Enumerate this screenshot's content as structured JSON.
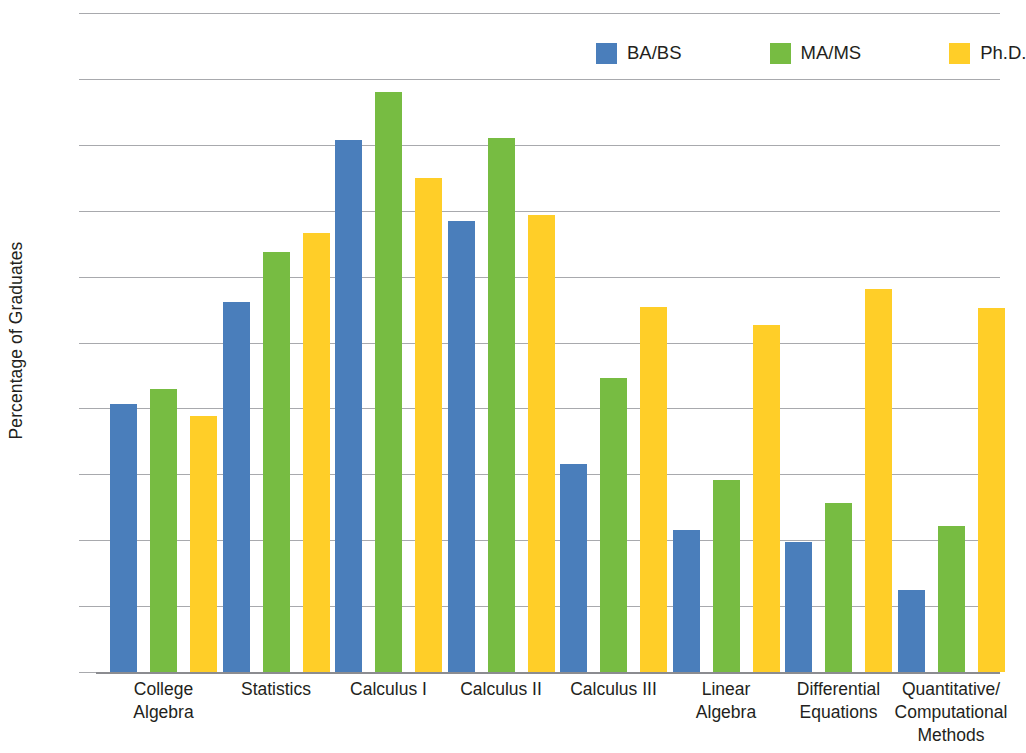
{
  "chart_data": {
    "type": "bar",
    "title": "",
    "xlabel": "",
    "ylabel": "Percentage of Graduates",
    "ylim": [
      0,
      100
    ],
    "ytick_labels": [
      "100%",
      "90%",
      "80%",
      "70%",
      "60%",
      "50%",
      "40%",
      "30%",
      "20%",
      "10%",
      "0%"
    ],
    "ytick_values": [
      100,
      90,
      80,
      70,
      60,
      50,
      40,
      30,
      20,
      10,
      0
    ],
    "grid": true,
    "legend_position": "top-right",
    "categories": [
      "College Algebra",
      "Statistics",
      "Calculus I",
      "Calculus II",
      "Calculus III",
      "Linear Algebra",
      "Differential Equations",
      "Quantitative/ Computational Methods"
    ],
    "category_lines": [
      [
        "College",
        "Algebra"
      ],
      [
        "Statistics"
      ],
      [
        "Calculus I"
      ],
      [
        "Calculus II"
      ],
      [
        "Calculus III"
      ],
      [
        "Linear",
        "Algebra"
      ],
      [
        "Differential",
        "Equations"
      ],
      [
        "Quantitative/",
        "Computational",
        "Methods"
      ]
    ],
    "series": [
      {
        "name": "BA/BS",
        "color": "#4a7ebb",
        "values": [
          40.7,
          56.2,
          80.8,
          68.4,
          31.5,
          21.5,
          19.8,
          12.4
        ]
      },
      {
        "name": "MA/MS",
        "color": "#77bc42",
        "values": [
          43.0,
          63.7,
          88.0,
          81.0,
          44.6,
          29.1,
          25.6,
          22.1
        ]
      },
      {
        "name": "Ph.D.",
        "color": "#ffce28",
        "values": [
          38.8,
          66.6,
          74.9,
          69.4,
          55.4,
          52.6,
          58.1,
          55.3
        ]
      }
    ]
  },
  "legend": {
    "items": [
      {
        "label": "BA/BS"
      },
      {
        "label": "MA/MS"
      },
      {
        "label": "Ph.D."
      }
    ]
  }
}
